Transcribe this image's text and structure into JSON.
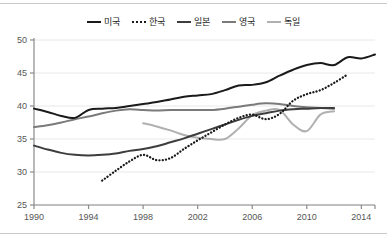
{
  "chart_data": {
    "type": "line",
    "title": "",
    "subtitle": "",
    "xlabel": "",
    "ylabel": "",
    "xlim": [
      1990,
      2015
    ],
    "ylim": [
      25,
      50
    ],
    "xticks": [
      1990,
      1994,
      1998,
      2002,
      2006,
      2010,
      2014
    ],
    "yticks": [
      25,
      30,
      35,
      40,
      45,
      50
    ],
    "grid": "horizontal",
    "legend_position": "top-center",
    "x": [
      1990,
      1991,
      1992,
      1993,
      1994,
      1995,
      1996,
      1997,
      1998,
      1999,
      2000,
      2001,
      2002,
      2003,
      2004,
      2005,
      2006,
      2007,
      2008,
      2009,
      2010,
      2011,
      2012,
      2013,
      2014,
      2015
    ],
    "series": [
      {
        "name": "미국",
        "style": "solid",
        "color": "#1a1a1a",
        "width": 2.0,
        "x": [
          1990,
          1991,
          1992,
          1993,
          1994,
          1995,
          1996,
          1997,
          1998,
          1999,
          2000,
          2001,
          2002,
          2003,
          2004,
          2005,
          2006,
          2007,
          2008,
          2009,
          2010,
          2011,
          2012,
          2013,
          2014,
          2015
        ],
        "values": [
          39.6,
          39.1,
          38.5,
          38.2,
          39.4,
          39.6,
          39.7,
          40.0,
          40.3,
          40.6,
          41.0,
          41.4,
          41.6,
          41.8,
          42.4,
          43.1,
          43.2,
          43.6,
          44.6,
          45.5,
          46.2,
          46.5,
          46.2,
          47.4,
          47.2,
          47.8
        ],
        "label": "USA"
      },
      {
        "name": "한국",
        "style": "dotted",
        "color": "#1a1a1a",
        "width": 2.0,
        "x": [
          1995,
          1996,
          1997,
          1998,
          1999,
          2000,
          2001,
          2002,
          2003,
          2004,
          2005,
          2006,
          2007,
          2008,
          2009,
          2010,
          2011,
          2012,
          2013
        ],
        "values": [
          28.7,
          30.2,
          31.6,
          32.6,
          31.8,
          32.1,
          33.5,
          34.8,
          36.0,
          37.2,
          38.2,
          38.7,
          38.0,
          38.8,
          40.8,
          41.8,
          42.4,
          43.5,
          44.8
        ],
        "label": "Korea"
      },
      {
        "name": "일본",
        "style": "solid",
        "color": "#3d3d3d",
        "width": 2.0,
        "x": [
          1990,
          1991,
          1992,
          1993,
          1994,
          1995,
          1996,
          1997,
          1998,
          1999,
          2000,
          2001,
          2002,
          2003,
          2004,
          2005,
          2006,
          2007,
          2008,
          2009,
          2010,
          2011,
          2012
        ],
        "values": [
          34.0,
          33.4,
          32.9,
          32.6,
          32.5,
          32.6,
          32.8,
          33.2,
          33.5,
          33.9,
          34.5,
          35.1,
          35.8,
          36.5,
          37.2,
          37.9,
          38.5,
          38.9,
          39.3,
          39.5,
          39.6,
          39.7,
          39.7
        ],
        "label": "Japan"
      },
      {
        "name": "영국",
        "style": "solid",
        "color": "#7a7a7a",
        "width": 2.0,
        "x": [
          1990,
          1991,
          1992,
          1993,
          1994,
          1995,
          1996,
          1997,
          1998,
          1999,
          2000,
          2001,
          2002,
          2003,
          2004,
          2005,
          2006,
          2007,
          2008,
          2009,
          2010,
          2011,
          2012
        ],
        "values": [
          36.8,
          37.1,
          37.5,
          38.0,
          38.4,
          38.9,
          39.3,
          39.5,
          39.4,
          39.3,
          39.4,
          39.4,
          39.4,
          39.4,
          39.6,
          39.9,
          40.2,
          40.4,
          40.3,
          40.0,
          39.8,
          39.7,
          39.6
        ],
        "label": "UK"
      },
      {
        "name": "독일",
        "style": "solid",
        "color": "#b0b0b0",
        "width": 2.0,
        "x": [
          1998,
          1999,
          2000,
          2001,
          2002,
          2003,
          2004,
          2005,
          2006,
          2007,
          2008,
          2009,
          2010,
          2011,
          2012
        ],
        "values": [
          37.4,
          36.9,
          36.3,
          35.6,
          35.2,
          35.0,
          35.0,
          36.6,
          38.6,
          39.3,
          39.4,
          37.2,
          36.2,
          38.7,
          39.2
        ],
        "label": "Germany"
      }
    ]
  },
  "legend": {
    "entries": [
      {
        "label": "미국",
        "style": "solid",
        "color": "#1a1a1a"
      },
      {
        "label": "한국",
        "style": "dotted",
        "color": "#1a1a1a"
      },
      {
        "label": "일본",
        "style": "solid",
        "color": "#3d3d3d"
      },
      {
        "label": "영국",
        "style": "solid",
        "color": "#7a7a7a"
      },
      {
        "label": "독일",
        "style": "solid",
        "color": "#b0b0b0"
      }
    ]
  },
  "axes": {
    "y_tick_labels": [
      "50",
      "45",
      "40",
      "35",
      "30",
      "25"
    ],
    "x_tick_labels": [
      "1990",
      "1994",
      "1998",
      "2002",
      "2006",
      "2010",
      "2014"
    ],
    "axis_color": "#8a8a8a",
    "grid_color": "#e8e8e8",
    "tick_text_color": "#555555"
  },
  "frame": {
    "border_color": "#c9c9c9",
    "background": "#ffffff"
  }
}
